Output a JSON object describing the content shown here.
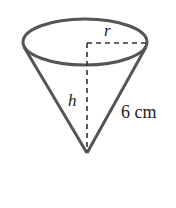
{
  "diagram": {
    "type": "cone",
    "labels": {
      "radius": "r",
      "height": "h",
      "slant": "6 cm"
    },
    "colors": {
      "stroke": "#555555",
      "dashed": "#333333",
      "text": "#222222"
    }
  }
}
